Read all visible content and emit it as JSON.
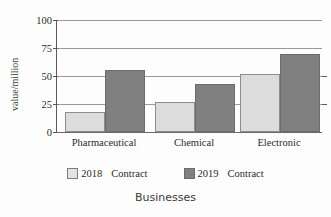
{
  "chart_data": {
    "type": "bar",
    "title": "",
    "xlabel": "Businesses",
    "ylabel": "value/million",
    "categories": [
      "Pharmaceutical",
      "Chemical",
      "Electronic"
    ],
    "series": [
      {
        "name": "2018  Contract",
        "values": [
          18,
          27,
          52
        ],
        "color": "#dcdcdc"
      },
      {
        "name": "2019  Contract",
        "values": [
          55,
          43,
          70
        ],
        "color": "#808080"
      }
    ],
    "ylim": [
      0,
      100
    ],
    "yticks": [
      0,
      25,
      50,
      75,
      100
    ],
    "ytick_labels": [
      "0",
      "25",
      "50",
      "75",
      "100"
    ],
    "grid": true,
    "legend_position": "bottom"
  },
  "legend": {
    "items": [
      {
        "year": "2018",
        "label": "Contract"
      },
      {
        "year": "2019",
        "label": "Contract"
      }
    ]
  }
}
